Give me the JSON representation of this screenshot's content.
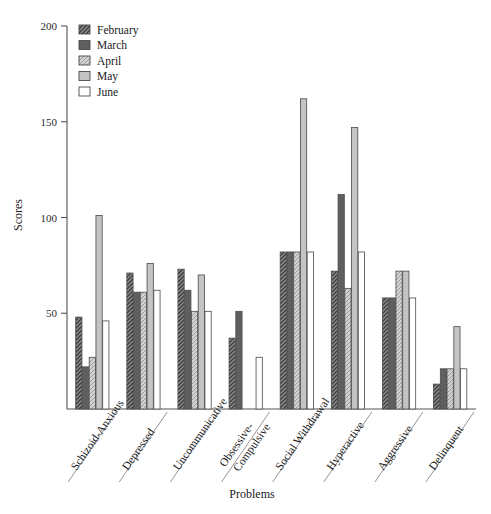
{
  "chart_data": {
    "type": "bar",
    "title": "",
    "xlabel": "Problems",
    "ylabel": "Scores",
    "ylim": [
      0,
      200
    ],
    "yticks": [
      0,
      50,
      100,
      150,
      200
    ],
    "ytick_labels": [
      "",
      "50",
      "100",
      "150",
      "200"
    ],
    "grid": false,
    "legend_position": "top-left",
    "categories": [
      "Schizoid-Anxious",
      "Depressed",
      "Uncommunicative",
      "Obsessive-Compulsive",
      "Social Withdrawal",
      "Hyperactive",
      "Aggressive",
      "Delinquent"
    ],
    "series": [
      {
        "name": "February",
        "fill": "hatch-dense-dark",
        "color": "#6b6b6b",
        "values": [
          48,
          71,
          73,
          37,
          82,
          72,
          58,
          13
        ]
      },
      {
        "name": "March",
        "fill": "solid-dark-gray",
        "color": "#5a5a5a",
        "values": [
          22,
          61,
          62,
          51,
          82,
          112,
          58,
          21
        ]
      },
      {
        "name": "April",
        "fill": "hatch-light",
        "color": "#c9c9c9",
        "values": [
          27,
          61,
          51,
          0,
          82,
          63,
          72,
          21
        ]
      },
      {
        "name": "May",
        "fill": "solid-light-gray",
        "color": "#bdbdbd",
        "values": [
          101,
          76,
          70,
          0,
          162,
          147,
          72,
          43
        ]
      },
      {
        "name": "June",
        "fill": "white",
        "color": "#ffffff",
        "values": [
          46,
          62,
          51,
          27,
          82,
          82,
          58,
          21
        ]
      }
    ]
  }
}
